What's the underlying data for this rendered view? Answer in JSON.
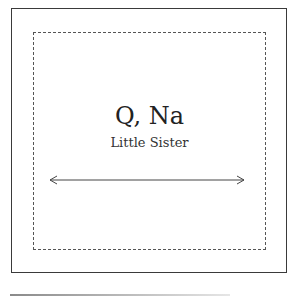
{
  "diagram": {
    "title": "Q, Na",
    "subtitle": "Little Sister",
    "arrow": {
      "type": "double-headed",
      "orientation": "horizontal"
    },
    "frames": {
      "outer": {
        "style": "solid",
        "color": "#3a3a3a"
      },
      "inner": {
        "style": "dashed",
        "color": "#555555"
      }
    }
  },
  "colors": {
    "background": "#ffffff",
    "text": "#222222",
    "line": "#444444"
  }
}
